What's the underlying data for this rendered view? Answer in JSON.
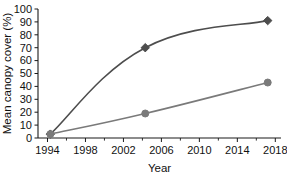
{
  "chart_data": {
    "type": "line",
    "title": "",
    "xlabel": "Year",
    "ylabel": "Mean canopy cover (%)",
    "xlim": [
      1993,
      2018.6
    ],
    "ylim": [
      0,
      100
    ],
    "grid": false,
    "legend": "none",
    "x_ticks": [
      1994,
      1998,
      2002,
      2006,
      2010,
      2014,
      2018
    ],
    "x_tick_labels": [
      "1994",
      "1998",
      "2002",
      "2006",
      "2010",
      "2014",
      "2018"
    ],
    "x_minor_ticks": [
      1996,
      2000,
      2004,
      2008,
      2012,
      2016
    ],
    "y_ticks": [
      0,
      10,
      20,
      30,
      40,
      50,
      60,
      70,
      80,
      90,
      100
    ],
    "y_tick_labels": [
      "0",
      "10",
      "20",
      "30",
      "40",
      "50",
      "60",
      "70",
      "80",
      "90",
      "100"
    ],
    "series": [
      {
        "name": "upper-series",
        "marker": "diamond",
        "color": "#4d4d4d",
        "x": [
          1994.3,
          2004.3,
          2017.2
        ],
        "values": [
          3,
          70,
          91
        ]
      },
      {
        "name": "lower-series",
        "marker": "circle",
        "color": "#7a7a7a",
        "x": [
          1994.3,
          2004.3,
          2017.2
        ],
        "values": [
          3,
          19,
          43
        ]
      }
    ]
  },
  "colors": {
    "axis": "#1a1a1a",
    "text": "#111111",
    "background": "#ffffff",
    "series_upper": "#4d4d4d",
    "series_lower": "#7a7a7a"
  }
}
